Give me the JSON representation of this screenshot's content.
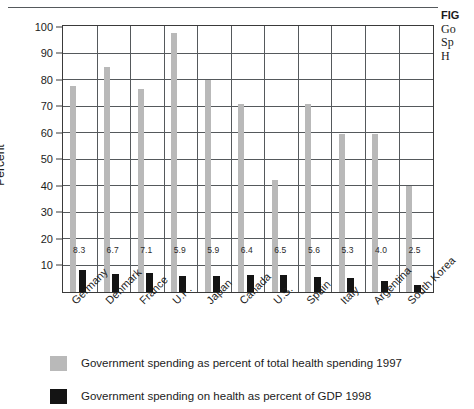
{
  "caption": {
    "title": "FIG",
    "lines": [
      "Go",
      "Sp",
      "H"
    ]
  },
  "chart_data": {
    "type": "bar",
    "title": "",
    "xlabel": "",
    "ylabel": "Percent",
    "ylim": [
      0,
      100
    ],
    "yticks": [
      10,
      20,
      30,
      40,
      50,
      60,
      70,
      80,
      90,
      100
    ],
    "grid": true,
    "legend_position": "bottom-left",
    "categories": [
      "Germany",
      "Denmark",
      "France",
      "U.K.",
      "Japan",
      "Canada",
      "U.S.",
      "Spain",
      "Italy",
      "Argentina",
      "South Korea"
    ],
    "series": [
      {
        "name": "Government spending as percent of total health spending 1997",
        "color": "#b9b9b9",
        "values": [
          77.8,
          84.9,
          76.8,
          97.7,
          80.0,
          70.8,
          42.2,
          71.0,
          59.8,
          59.8,
          40.0
        ]
      },
      {
        "name": "Government spending on health as percent of GDP 1998",
        "color": "#141414",
        "values": [
          8.3,
          6.7,
          7.1,
          5.9,
          5.9,
          6.4,
          6.5,
          5.6,
          5.3,
          4.0,
          2.5
        ],
        "data_labels": [
          "8.3",
          "6.7",
          "7.1",
          "5.9",
          "5.9",
          "6.4",
          "6.5",
          "5.6",
          "5.3",
          "4.0",
          "2.5"
        ]
      }
    ]
  },
  "legend": {
    "items": [
      {
        "label": "Government spending as percent of total health spending 1997",
        "color": "#b9b9b9"
      },
      {
        "label": "Government spending on health as percent of GDP 1998",
        "color": "#141414"
      }
    ]
  }
}
